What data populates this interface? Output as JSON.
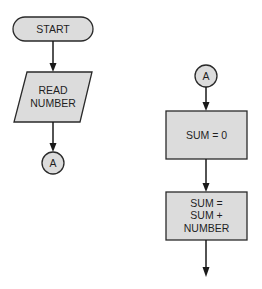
{
  "diagram": {
    "type": "flowchart",
    "left_flow": {
      "start": {
        "shape": "terminal",
        "label": "START"
      },
      "input": {
        "shape": "parallelogram",
        "lines": [
          "READ",
          "NUMBER"
        ]
      },
      "connector": {
        "shape": "circle",
        "label": "A"
      }
    },
    "right_flow": {
      "connector": {
        "shape": "circle",
        "label": "A"
      },
      "process1": {
        "shape": "rectangle",
        "lines": [
          "SUM = 0"
        ]
      },
      "process2": {
        "shape": "rectangle",
        "lines": [
          "SUM =",
          "SUM +",
          "NUMBER"
        ]
      },
      "exit_arrow": "arrow-down"
    },
    "edges": [
      [
        "START",
        "READ NUMBER"
      ],
      [
        "READ NUMBER",
        "A"
      ],
      [
        "A",
        "SUM = 0"
      ],
      [
        "SUM = 0",
        "SUM = SUM + NUMBER"
      ],
      [
        "SUM = SUM + NUMBER",
        "continue"
      ]
    ],
    "colors": {
      "fill": "#dcdcdc",
      "stroke": "#2a2a2a",
      "background": "#ffffff"
    }
  }
}
